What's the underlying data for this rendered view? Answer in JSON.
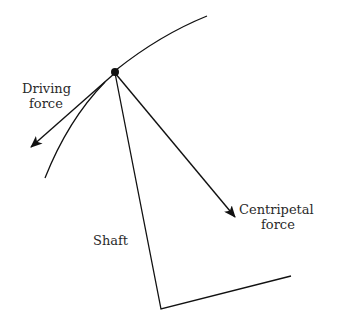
{
  "diagram": {
    "labels": {
      "driving_line1": "Driving",
      "driving_line2": "force",
      "centripetal_line1": "Centripetal",
      "centripetal_line2": "force",
      "shaft": "Shaft"
    },
    "colors": {
      "stroke": "#111111",
      "text": "#2a2a2a",
      "background": "#ffffff"
    }
  }
}
